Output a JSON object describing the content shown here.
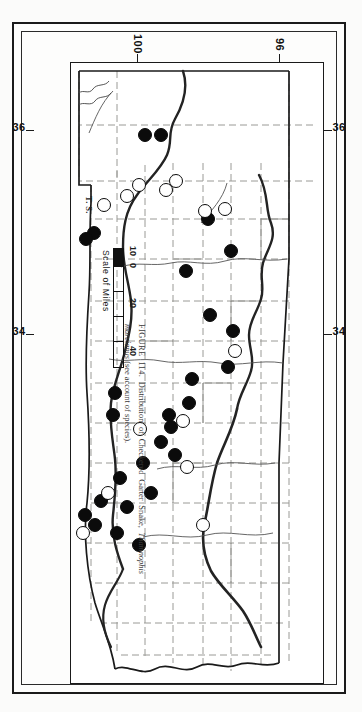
{
  "figure": {
    "number": "FIGURE 114.",
    "caption_line": "Distribution of Checkered Garter Snake, Thamnophis marcianus (see account of species).",
    "caption_part1": "Distribution of Checkered Garter",
    "caption_species": "Thamnophis marcianus",
    "caption_part2": "Snake,",
    "caption_part3": "(see account of",
    "caption_part4": "species).",
    "artist_initials": "T. S."
  },
  "scale": {
    "label": "Scale of Miles",
    "ticks": [
      "10",
      "0",
      "20",
      "40"
    ],
    "unit": "Miles"
  },
  "graticule": {
    "top_left": "36",
    "top_right": "34",
    "bottom_left": "36",
    "bottom_right": "34",
    "left_upper": "96",
    "left_lower": "100",
    "right_upper": "96",
    "right_lower": "100"
  },
  "legend": {
    "solid_meaning": "specimen record",
    "open_meaning": "literature or sight record"
  },
  "colors": {
    "ink": "#0b0b0b",
    "paper": "#fdfdfc",
    "county_line": "#9a9a96",
    "river_line": "#2b2b2b",
    "caption_text": "#3b3a38"
  },
  "chart_data": {
    "type": "scatter",
    "title": "Distribution of Checkered Garter Snake, Thamnophis marcianus",
    "xlabel": "Longitude (W)",
    "ylabel": "Latitude (N)",
    "xlim": [
      103.0,
      94.4
    ],
    "ylim": [
      33.6,
      37.0
    ],
    "grid": false,
    "legend_position": "none",
    "series": [
      {
        "name": "solid-circle-records",
        "marker": "filled circle",
        "points": [
          [
            103.0,
            36.75
          ],
          [
            103.0,
            36.45
          ],
          [
            100.2,
            34.8
          ],
          [
            100.15,
            34.62
          ],
          [
            100.0,
            35.55
          ],
          [
            99.5,
            36.05
          ],
          [
            99.2,
            35.35
          ],
          [
            98.6,
            35.75
          ],
          [
            97.9,
            35.95
          ],
          [
            97.3,
            36.25
          ],
          [
            97.1,
            35.55
          ],
          [
            96.6,
            35.55
          ],
          [
            96.45,
            35.25
          ],
          [
            96.2,
            35.4
          ],
          [
            96.0,
            35.1
          ],
          [
            95.7,
            35.25
          ],
          [
            95.55,
            34.95
          ],
          [
            95.4,
            34.6
          ],
          [
            95.1,
            34.75
          ],
          [
            94.95,
            34.4
          ],
          [
            96.5,
            34.45
          ],
          [
            96.4,
            34.15
          ],
          [
            96.15,
            34.0
          ],
          [
            95.85,
            34.05
          ],
          [
            95.6,
            33.95
          ],
          [
            97.5,
            34.35
          ],
          [
            98.3,
            34.35
          ]
        ]
      },
      {
        "name": "open-circle-records",
        "marker": "open circle",
        "points": [
          [
            99.9,
            36.3
          ],
          [
            99.9,
            36.1
          ],
          [
            100.6,
            35.55
          ],
          [
            100.5,
            35.35
          ],
          [
            100.5,
            35.0
          ],
          [
            100.35,
            34.85
          ],
          [
            100.1,
            34.45
          ],
          [
            97.25,
            36.2
          ],
          [
            96.35,
            35.45
          ],
          [
            96.55,
            35.05
          ],
          [
            95.7,
            35.45
          ],
          [
            95.0,
            35.7
          ],
          [
            96.1,
            34.25
          ],
          [
            95.75,
            33.95
          ]
        ]
      }
    ]
  },
  "dots_solid": [
    {
      "x": 72,
      "y": 162,
      "r": 7
    },
    {
      "x": 72,
      "y": 178,
      "r": 7
    },
    {
      "x": 170,
      "y": 229,
      "r": 7
    },
    {
      "x": 176,
      "y": 237,
      "r": 7
    },
    {
      "x": 156,
      "y": 115,
      "r": 7
    },
    {
      "x": 188,
      "y": 92,
      "r": 7
    },
    {
      "x": 208,
      "y": 137,
      "r": 7
    },
    {
      "x": 252,
      "y": 113,
      "r": 7
    },
    {
      "x": 268,
      "y": 90,
      "r": 7
    },
    {
      "x": 304,
      "y": 95,
      "r": 7
    },
    {
      "x": 316,
      "y": 131,
      "r": 7
    },
    {
      "x": 340,
      "y": 134,
      "r": 7
    },
    {
      "x": 352,
      "y": 154,
      "r": 7
    },
    {
      "x": 364,
      "y": 152,
      "r": 7
    },
    {
      "x": 379,
      "y": 162,
      "r": 7
    },
    {
      "x": 392,
      "y": 148,
      "r": 7
    },
    {
      "x": 400,
      "y": 180,
      "r": 7
    },
    {
      "x": 415,
      "y": 203,
      "r": 7
    },
    {
      "x": 430,
      "y": 172,
      "r": 7
    },
    {
      "x": 444,
      "y": 196,
      "r": 7
    },
    {
      "x": 438,
      "y": 222,
      "r": 7
    },
    {
      "x": 452,
      "y": 238,
      "r": 7
    },
    {
      "x": 462,
      "y": 228,
      "r": 7
    },
    {
      "x": 470,
      "y": 206,
      "r": 7
    },
    {
      "x": 482,
      "y": 184,
      "r": 7
    },
    {
      "x": 352,
      "y": 210,
      "r": 7
    },
    {
      "x": 330,
      "y": 208,
      "r": 7
    }
  ],
  "dots_open": [
    {
      "x": 146,
      "y": 98,
      "r": 7
    },
    {
      "x": 148,
      "y": 118,
      "r": 7
    },
    {
      "x": 118,
      "y": 147,
      "r": 7
    },
    {
      "x": 127,
      "y": 157,
      "r": 7
    },
    {
      "x": 122,
      "y": 184,
      "r": 7
    },
    {
      "x": 133,
      "y": 196,
      "r": 7
    },
    {
      "x": 142,
      "y": 219,
      "r": 7
    },
    {
      "x": 288,
      "y": 88,
      "r": 7
    },
    {
      "x": 358,
      "y": 140,
      "r": 7
    },
    {
      "x": 366,
      "y": 183,
      "r": 7
    },
    {
      "x": 404,
      "y": 136,
      "r": 7
    },
    {
      "x": 462,
      "y": 120,
      "r": 7
    },
    {
      "x": 430,
      "y": 215,
      "r": 7
    },
    {
      "x": 470,
      "y": 240,
      "r": 7
    }
  ]
}
